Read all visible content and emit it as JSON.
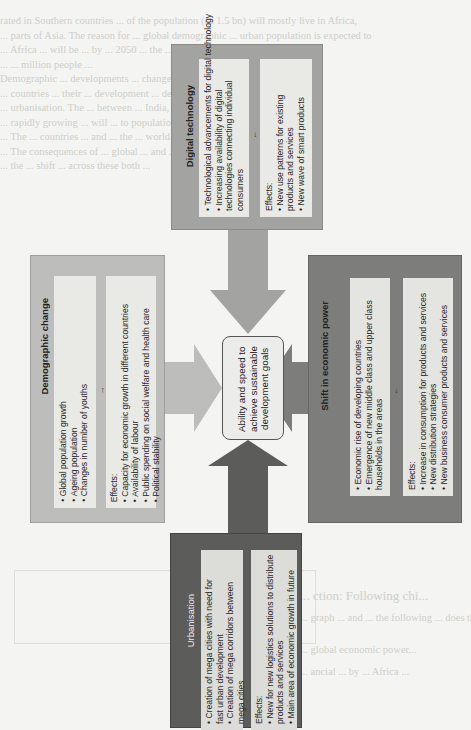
{
  "page": {
    "background_text": {
      "top_lines": [
        "rated in Southern countries ... of the population (ca 1.5 bn) will mostly live in Africa,",
        "... parts of Asia. The reason for ... global demographic ... urban population is expected to",
        "... Africa ... will be ... by ... 2050 ... the ... 336 million people in 2050",
        "... ... million people ...",
        "Demographic ... developments ... changes in ... of different countries",
        "... countries ... their ... development ... depend on the",
        "... urbanisation. The ... between ... India, ... and",
        "... rapidly growing ... will ... to population ... the",
        "... The ... countries ... and ... the ... world ... regions ... very",
        "... The consequences of ... global ... and ... in ... countries ...",
        "... the ... shift ... across these both ..."
      ],
      "bottom_lines": [
        "... ction: Following chi...",
        "... graph ... and ... the following ... does the diagram?",
        "... global economic power...",
        "... ancial ... by ... Africa ..."
      ]
    }
  },
  "diagram": {
    "center": {
      "label": "Ability and speed to achieve sustainable development goals"
    },
    "boxes": {
      "digital_technology": {
        "title": "Digital technology",
        "drivers": [
          "Technological advancements for digital technology",
          "Increasing availability of digital technologies connecting individual consumers"
        ],
        "effects_label": "Effects:",
        "effects": [
          "New use patterns for existing products and services",
          "New wave of smart products"
        ],
        "color": "#a3a3a1"
      },
      "demographic_change": {
        "title": "Demographic change",
        "drivers": [
          "Global population growth",
          "Ageing population",
          "Changes in number of youths"
        ],
        "effects_label": "Effects:",
        "effects": [
          "Capacity for economic growth in different countries",
          "Availability of labour",
          "Public spending on social welfare and health care",
          "Political stability"
        ],
        "color": "#bdbdbb"
      },
      "shift_in_economic_power": {
        "title": "Shift in economic power",
        "drivers": [
          "Economic rise of developing countries",
          "Emergence of new middle class and upper class households in the areas"
        ],
        "effects_label": "Effects:",
        "effects": [
          "Increase in consumption for products and services",
          "New distribution strategies",
          "New business consumer products and services"
        ],
        "color": "#7d7d7b"
      },
      "urbanisation": {
        "title": "Urbanisation",
        "drivers": [
          "Creation of mega cities with need for fast urban development",
          "Creation of mega corridors between mega cities"
        ],
        "effects_label": "Effects:",
        "effects": [
          "New for new logistics solutions to distribute products and services",
          "Main area of economic growth in future"
        ],
        "color": "#5c5c5a"
      }
    },
    "arrow_glyph": "→"
  }
}
